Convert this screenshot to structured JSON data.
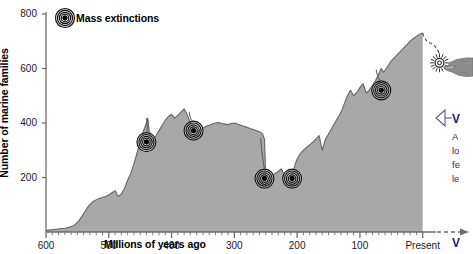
{
  "chart_data": {
    "type": "area",
    "title": "",
    "xlabel": "Millions of years ago",
    "ylabel": "Number of marine families",
    "xlim": [
      600,
      -18
    ],
    "ylim": [
      0,
      800
    ],
    "x_ticks": [
      "600",
      "500",
      "400",
      "300",
      "200",
      "100",
      "Present"
    ],
    "x_tick_values": [
      600,
      500,
      400,
      300,
      200,
      100,
      0
    ],
    "y_ticks": [
      "200",
      "400",
      "600",
      "800"
    ],
    "y_tick_values": [
      200,
      400,
      600,
      800
    ],
    "grid": false,
    "legend": [
      {
        "label": "Mass extinctions",
        "marker": "concentric-rings-target"
      }
    ],
    "series": [
      {
        "name": "Number of marine families",
        "x": [
          600,
          592,
          585,
          578,
          570,
          562,
          555,
          548,
          540,
          532,
          525,
          518,
          512,
          505,
          500,
          495,
          490,
          485,
          480,
          475,
          470,
          465,
          460,
          455,
          450,
          445,
          440,
          438,
          435,
          430,
          425,
          420,
          415,
          410,
          405,
          400,
          395,
          390,
          385,
          380,
          375,
          370,
          365,
          360,
          355,
          350,
          345,
          340,
          335,
          330,
          325,
          320,
          315,
          310,
          305,
          300,
          295,
          290,
          285,
          280,
          275,
          270,
          265,
          260,
          255,
          252,
          250,
          247,
          245,
          242,
          240,
          235,
          230,
          225,
          220,
          215,
          210,
          208,
          205,
          203,
          200,
          195,
          190,
          185,
          180,
          175,
          170,
          165,
          160,
          155,
          150,
          145,
          140,
          135,
          130,
          125,
          120,
          115,
          110,
          105,
          100,
          95,
          90,
          85,
          80,
          75,
          70,
          66,
          62,
          58,
          54,
          50,
          45,
          40,
          35,
          30,
          25,
          20,
          15,
          10,
          5,
          0
        ],
        "y": [
          6,
          8,
          10,
          12,
          14,
          18,
          24,
          40,
          68,
          96,
          112,
          120,
          126,
          130,
          136,
          144,
          152,
          130,
          140,
          160,
          190,
          215,
          250,
          290,
          330,
          370,
          400,
          418,
          360,
          330,
          352,
          372,
          392,
          410,
          424,
          432,
          418,
          428,
          440,
          452,
          430,
          400,
          386,
          368,
          374,
          382,
          388,
          392,
          396,
          400,
          402,
          398,
          396,
          394,
          398,
          400,
          396,
          392,
          388,
          384,
          380,
          376,
          372,
          368,
          360,
          340,
          196,
          190,
          196,
          204,
          206,
          215,
          222,
          232,
          206,
          198,
          206,
          214,
          232,
          250,
          268,
          288,
          300,
          310,
          320,
          330,
          342,
          354,
          300,
          340,
          360,
          380,
          400,
          420,
          440,
          470,
          500,
          520,
          500,
          512,
          530,
          545,
          510,
          520,
          538,
          556,
          580,
          600,
          586,
          600,
          614,
          628,
          640,
          652,
          664,
          676,
          688,
          700,
          710,
          718,
          726,
          730
        ]
      }
    ],
    "markers": [
      {
        "label": "Late Ordovician",
        "x": 440,
        "y": 330,
        "pin_x": 440,
        "pin_y": 418
      },
      {
        "label": "Late Devonian",
        "x": 365,
        "y": 372,
        "pin_x": 372,
        "pin_y": 440
      },
      {
        "label": "Permian",
        "x": 252,
        "y": 196,
        "pin_x": 258,
        "pin_y": 345
      },
      {
        "label": "Triassic",
        "x": 208,
        "y": 196,
        "pin_x": 214,
        "pin_y": 232
      },
      {
        "label": "Cretaceous",
        "x": 66,
        "y": 520,
        "pin_x": 74,
        "pin_y": 596
      },
      {
        "label": "Future projection",
        "x": -14,
        "y": 628,
        "pin_x": 0,
        "pin_y": 730,
        "style": "dashed-starburst"
      }
    ],
    "annotations": {
      "projection_note": "dashed line extending from present-day curve toward future mass extinction",
      "pointer": "hand pointing at projected mass extinction"
    }
  },
  "callout": {
    "arrow_icon": "left-arrow-callout-icon",
    "heading": "V",
    "lines": [
      "A",
      "lo",
      "fe",
      "le"
    ],
    "bottom_heading": "V",
    "accent_color": "#23235e"
  },
  "colors": {
    "area_fill": "#a8a8a8",
    "curve_line": "#5f5f5f",
    "axis": "#6d6d6d",
    "text": "#000000",
    "callout_accent": "#23235e",
    "hand": "#8d8d8d"
  }
}
